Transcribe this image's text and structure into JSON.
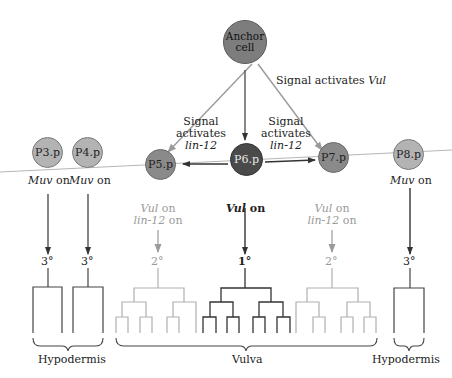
{
  "anchor_cell": {
    "line1": "Anchor",
    "line2": "cell",
    "color": "#7d7d7d"
  },
  "signals": {
    "vul": {
      "text": "Signal activates ",
      "gene": "Vul"
    },
    "lin12_left": {
      "line1": "Signal",
      "line2": "activates",
      "gene": "lin-12"
    },
    "lin12_right": {
      "line1": "Signal",
      "line2": "activates",
      "gene": "lin-12"
    }
  },
  "cells": [
    {
      "id": "P3.p",
      "color": "#b3b3b3"
    },
    {
      "id": "P4.p",
      "color": "#b3b3b3"
    },
    {
      "id": "P5.p",
      "color": "#8a8a8a"
    },
    {
      "id": "P6.p",
      "color": "#4a4a4a"
    },
    {
      "id": "P7.p",
      "color": "#8a8a8a"
    },
    {
      "id": "P8.p",
      "color": "#b3b3b3"
    }
  ],
  "gene_states": {
    "p3": {
      "gene": "Muv",
      "state": " on"
    },
    "p4": {
      "gene": "Muv",
      "state": " on"
    },
    "p5": {
      "gene": "Vul",
      "state": " on",
      "gene2": "lin-12",
      "state2": " on"
    },
    "p6": {
      "gene": "Vul",
      "state": " on"
    },
    "p7": {
      "gene": "Vul",
      "state": " on",
      "gene2": "lin-12",
      "state2": " on"
    },
    "p8": {
      "gene": "Muv",
      "state": " on"
    }
  },
  "fates": {
    "p3": "3°",
    "p4": "3°",
    "p5": "2°",
    "p6": "1°",
    "p7": "2°",
    "p8": "3°"
  },
  "outcomes": {
    "left": "Hypodermis",
    "middle": "Vulva",
    "right": "Hypodermis"
  },
  "colors": {
    "primary_line": "#333333",
    "secondary_line": "#a8a8a8",
    "axis_line": "#b0b0b0"
  }
}
